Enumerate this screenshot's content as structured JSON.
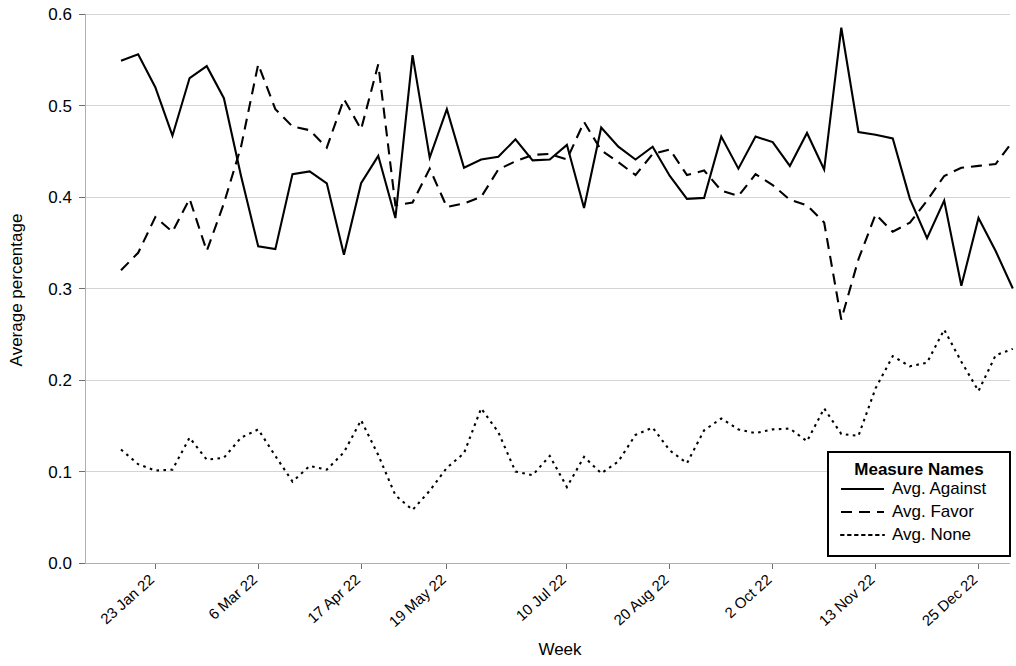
{
  "chart_data": {
    "type": "line",
    "title": "",
    "xlabel": "Week",
    "ylabel": "Average percentage",
    "ylim": [
      0.0,
      0.6
    ],
    "ytick_labels": [
      "0.0",
      "0.1",
      "0.2",
      "0.3",
      "0.4",
      "0.5",
      "0.6"
    ],
    "ytick_values": [
      0.0,
      0.1,
      0.2,
      0.3,
      0.4,
      0.5,
      0.6
    ],
    "grid": "horizontal",
    "legend_title": "Measure Names",
    "legend_position": "bottom-right-inside",
    "xtick_labels": [
      "23 Jan 22",
      "6 Mar 22",
      "17 Apr 22",
      "19 May 22",
      "10 Jul 22",
      "20 Aug 22",
      "2 Oct 22",
      "13 Nov 22",
      "25 Dec 22"
    ],
    "xtick_indices": [
      2,
      8,
      14,
      19,
      26,
      32,
      38,
      44,
      50
    ],
    "x_count": 53,
    "series": [
      {
        "name": "Avg. Against",
        "dash": "solid",
        "values": [
          0.549,
          0.556,
          0.52,
          0.467,
          0.53,
          0.543,
          0.508,
          0.423,
          0.346,
          0.343,
          0.425,
          0.428,
          0.415,
          0.337,
          0.415,
          0.445,
          0.377,
          0.555,
          0.443,
          0.496,
          0.432,
          0.441,
          0.444,
          0.463,
          0.44,
          0.441,
          0.457,
          0.388,
          0.476,
          0.455,
          0.441,
          0.455,
          0.423,
          0.398,
          0.399,
          0.466,
          0.431,
          0.466,
          0.46,
          0.434,
          0.47,
          0.43,
          0.585,
          0.471,
          0.468,
          0.464,
          0.398,
          0.355,
          0.396,
          0.303,
          0.377,
          0.341,
          0.3
        ]
      },
      {
        "name": "Avg. Favor",
        "dash": "dashed",
        "values": [
          0.32,
          0.339,
          0.378,
          0.362,
          0.398,
          0.341,
          0.393,
          0.455,
          0.545,
          0.496,
          0.477,
          0.473,
          0.454,
          0.507,
          0.474,
          0.545,
          0.391,
          0.394,
          0.431,
          0.389,
          0.393,
          0.4,
          0.43,
          0.439,
          0.446,
          0.447,
          0.441,
          0.482,
          0.451,
          0.438,
          0.424,
          0.447,
          0.452,
          0.424,
          0.429,
          0.407,
          0.401,
          0.425,
          0.413,
          0.397,
          0.391,
          0.372,
          0.266,
          0.332,
          0.381,
          0.362,
          0.372,
          0.396,
          0.423,
          0.432,
          0.434,
          0.436,
          0.461
        ]
      },
      {
        "name": "Avg. None",
        "dash": "dotted",
        "values": [
          0.124,
          0.108,
          0.101,
          0.102,
          0.137,
          0.113,
          0.115,
          0.137,
          0.146,
          0.117,
          0.089,
          0.106,
          0.102,
          0.121,
          0.156,
          0.118,
          0.074,
          0.058,
          0.079,
          0.104,
          0.12,
          0.169,
          0.143,
          0.1,
          0.096,
          0.117,
          0.083,
          0.116,
          0.098,
          0.111,
          0.14,
          0.148,
          0.123,
          0.109,
          0.145,
          0.158,
          0.146,
          0.142,
          0.146,
          0.147,
          0.133,
          0.169,
          0.141,
          0.139,
          0.191,
          0.226,
          0.215,
          0.219,
          0.255,
          0.22,
          0.188,
          0.227,
          0.234
        ]
      }
    ]
  },
  "legend": {
    "title": "Measure Names",
    "items": [
      {
        "label": "Avg. Against",
        "dash": "solid"
      },
      {
        "label": "Avg. Favor",
        "dash": "dashed"
      },
      {
        "label": "Avg. None",
        "dash": "dotted"
      }
    ]
  },
  "axes": {
    "x_title": "Week",
    "y_title": "Average percentage"
  },
  "colors": {
    "line": "#000000",
    "grid": "#d4d4d4",
    "background": "#ffffff"
  }
}
